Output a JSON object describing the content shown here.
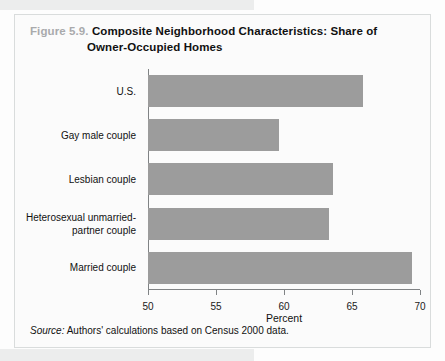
{
  "figure": {
    "number_label": "Figure 5.9.",
    "title_line_1": "Composite Neighborhood Characteristics: Share of",
    "title_line_2": "Owner-Occupied Homes",
    "source_lead": "Source:",
    "source_text": "Authors' calculations based on Census 2000 data.",
    "bar_color": "#9c9c9c",
    "axis_color": "#808385",
    "panel_border_color": "#d9dcdc",
    "figure_number_color": "#a9aaac"
  },
  "chart_data": {
    "type": "bar",
    "orientation": "horizontal",
    "title": "Figure 5.9. Composite Neighborhood Characteristics: Share of Owner-Occupied Homes",
    "xlabel": "Percent",
    "ylabel": "",
    "xlim": [
      50,
      70
    ],
    "xticks": [
      50,
      55,
      60,
      65,
      70
    ],
    "xtick_labels": [
      "50",
      "55",
      "60",
      "65",
      "70"
    ],
    "grid": false,
    "legend": null,
    "categories": [
      "U.S.",
      "Gay male couple",
      "Lesbian couple",
      "Heterosexual unmarried-partner couple",
      "Married couple"
    ],
    "category_lines": [
      [
        "U.S."
      ],
      [
        "Gay male couple"
      ],
      [
        "Lesbian couple"
      ],
      [
        "Heterosexual unmarried-",
        "partner couple"
      ],
      [
        "Married couple"
      ]
    ],
    "values": [
      65.8,
      59.6,
      63.6,
      63.3,
      69.4
    ],
    "source": "Source: Authors' calculations based on Census 2000 data."
  }
}
